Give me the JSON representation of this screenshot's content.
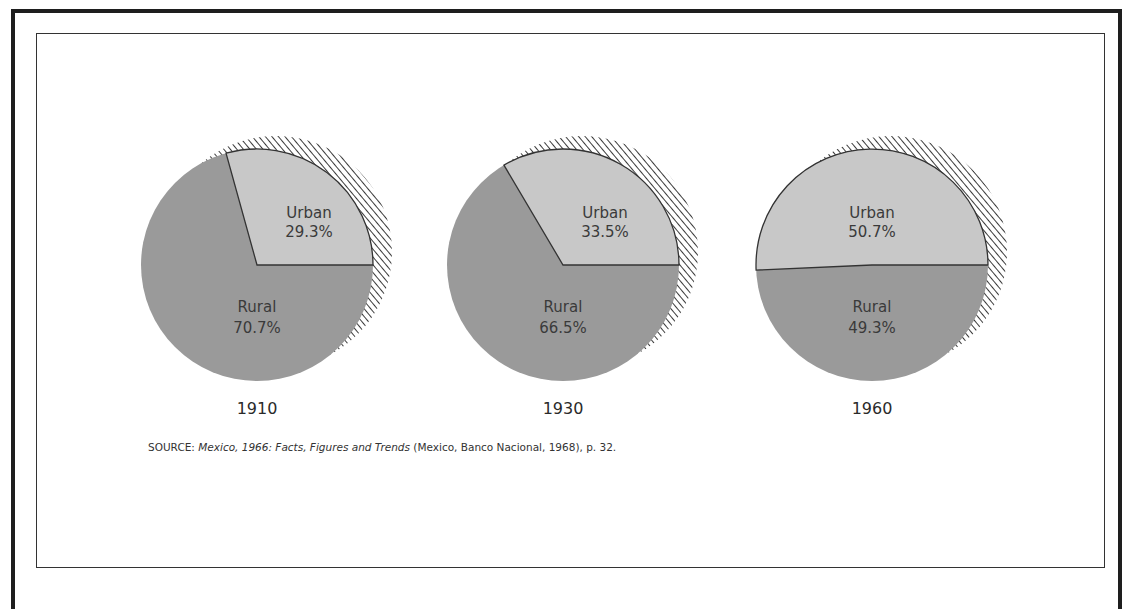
{
  "chart_data": [
    {
      "type": "pie",
      "title": "1910",
      "slices": [
        {
          "label": "Urban",
          "value": 29.3,
          "display": "29.3%",
          "color": "#c8c8c8"
        },
        {
          "label": "Rural",
          "value": 70.7,
          "display": "70.7%",
          "color": "#9a9a9a"
        }
      ]
    },
    {
      "type": "pie",
      "title": "1930",
      "slices": [
        {
          "label": "Urban",
          "value": 33.5,
          "display": "33.5%",
          "color": "#c8c8c8"
        },
        {
          "label": "Rural",
          "value": 66.5,
          "display": "66.5%",
          "color": "#9a9a9a"
        }
      ]
    },
    {
      "type": "pie",
      "title": "1960",
      "slices": [
        {
          "label": "Urban",
          "value": 50.7,
          "display": "50.7%",
          "color": "#c8c8c8"
        },
        {
          "label": "Rural",
          "value": 49.3,
          "display": "49.3%",
          "color": "#9a9a9a"
        }
      ]
    }
  ],
  "pies": [
    {
      "year": "1910",
      "urban_label": "Urban",
      "urban_value": "29.3%",
      "rural_label": "Rural",
      "rural_value": "70.7%"
    },
    {
      "year": "1930",
      "urban_label": "Urban",
      "urban_value": "33.5%",
      "rural_label": "Rural",
      "rural_value": "66.5%"
    },
    {
      "year": "1960",
      "urban_label": "Urban",
      "urban_value": "50.7%",
      "rural_label": "Rural",
      "rural_value": "49.3%"
    }
  ],
  "source": {
    "prefix": "SOURCE: ",
    "title_italic": "Mexico, 1966: Facts, Figures and Trends",
    "suffix": " (Mexico, Banco Nacional, 1968), p. 32."
  },
  "colors": {
    "urban": "#c8c8c8",
    "rural": "#9a9a9a",
    "divider": "#333333",
    "shadow_hatch": "#3a3a3a"
  }
}
